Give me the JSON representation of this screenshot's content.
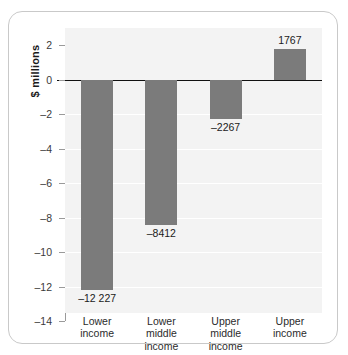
{
  "chart_data": {
    "type": "bar",
    "title": "",
    "subtitle": "",
    "xlabel": "",
    "ylabel": "$ millions",
    "categories": [
      "Lower income",
      "Lower middle income",
      "Upper middle income",
      "Upper income"
    ],
    "category_lines": [
      [
        "Lower",
        "income"
      ],
      [
        "Lower",
        "middle",
        "income"
      ],
      [
        "Upper",
        "middle",
        "income"
      ],
      [
        "Upper",
        "income"
      ]
    ],
    "values": [
      -12227,
      -8412,
      -2267,
      1767
    ],
    "value_labels": [
      "–12 227",
      "–8412",
      "–2267",
      "1767"
    ],
    "value_units": "thousands of $ millions (axis in $ millions)",
    "axis_values": [
      -12.227,
      -8.412,
      -2.267,
      1.767
    ],
    "ylim": [
      -14,
      3
    ],
    "yticks": [
      2,
      0,
      -2,
      -4,
      -6,
      -8,
      -10,
      -12,
      -14
    ],
    "ytick_labels": [
      "2",
      "0",
      "–2",
      "–4",
      "–6",
      "–8",
      "–10",
      "–12",
      "–14"
    ],
    "grid": true,
    "gridlines_at": [
      -2,
      -4,
      -6,
      -8,
      -10,
      -12
    ],
    "legend": null,
    "legend_position": "none",
    "bar_color": "#7b7b7b",
    "plot_background": "#f3f3f3",
    "gridline_color": "#ffffff",
    "zero_line_color": "#111111",
    "axis_color": "#9a9a9a",
    "card_background": "#ffffff",
    "card_border_color": "#c9c9c9"
  }
}
